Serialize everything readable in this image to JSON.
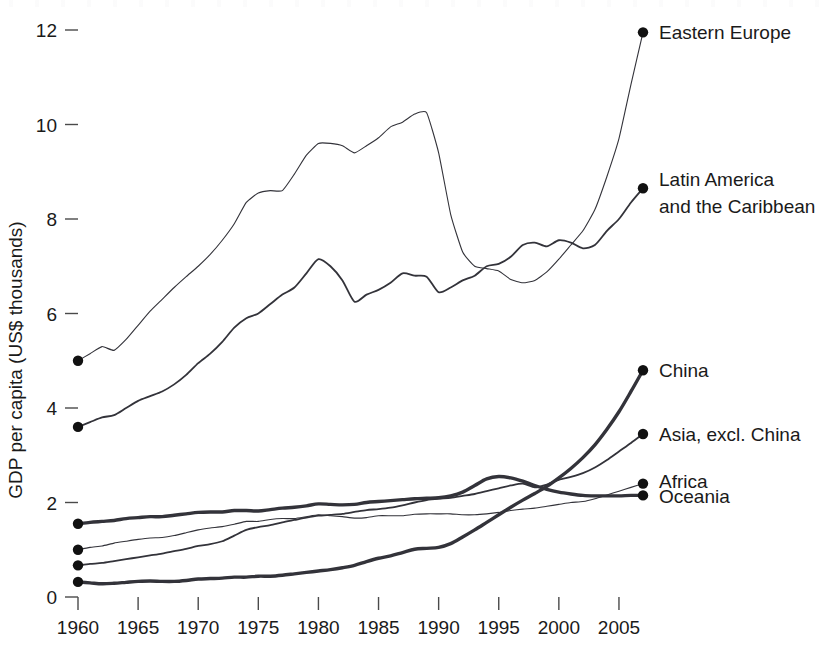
{
  "chart_data": {
    "type": "line",
    "title": "",
    "subtitle": "",
    "xlabel": "",
    "ylabel": "GDP per capita (US$ thousands)",
    "xlim": [
      1960,
      2007
    ],
    "ylim": [
      0,
      12
    ],
    "grid": false,
    "legend_position": "right-inline-endpoint-labels",
    "xticks": [
      1960,
      1965,
      1970,
      1975,
      1980,
      1985,
      1990,
      1995,
      2000,
      2005
    ],
    "xtick_labels": [
      "1960",
      "1965",
      "1970",
      "1975",
      "1980",
      "1985",
      "1990",
      "1995",
      "2000",
      "2005"
    ],
    "yticks": [
      0,
      2,
      4,
      6,
      8,
      10,
      12
    ],
    "ytick_labels": [
      "0",
      "2",
      "4",
      "6",
      "8",
      "10",
      "12"
    ],
    "x": [
      1960,
      1961,
      1962,
      1963,
      1964,
      1965,
      1966,
      1967,
      1968,
      1969,
      1970,
      1971,
      1972,
      1973,
      1974,
      1975,
      1976,
      1977,
      1978,
      1979,
      1980,
      1981,
      1982,
      1983,
      1984,
      1985,
      1986,
      1987,
      1988,
      1989,
      1990,
      1991,
      1992,
      1993,
      1994,
      1995,
      1996,
      1997,
      1998,
      1999,
      2000,
      2001,
      2002,
      2003,
      2004,
      2005,
      2006,
      2007
    ],
    "series": [
      {
        "name": "Eastern Europe",
        "label": "Eastern Europe",
        "style": "thin",
        "end_value": 11.95,
        "values": [
          5.0,
          5.15,
          5.3,
          5.22,
          5.45,
          5.75,
          6.05,
          6.3,
          6.55,
          6.78,
          7.0,
          7.25,
          7.55,
          7.9,
          8.35,
          8.55,
          8.6,
          8.6,
          8.95,
          9.35,
          9.6,
          9.6,
          9.55,
          9.4,
          9.55,
          9.72,
          9.95,
          10.05,
          10.22,
          10.25,
          9.4,
          8.1,
          7.3,
          7.0,
          6.95,
          6.9,
          6.72,
          6.65,
          6.7,
          6.88,
          7.15,
          7.45,
          7.75,
          8.2,
          8.9,
          9.7,
          10.85,
          11.95
        ]
      },
      {
        "name": "Latin America and the Caribbean",
        "label": "Latin America\nand the Caribbean",
        "style": "medium",
        "end_value": 8.65,
        "values": [
          3.6,
          3.7,
          3.8,
          3.85,
          4.0,
          4.15,
          4.25,
          4.35,
          4.5,
          4.7,
          4.95,
          5.15,
          5.4,
          5.7,
          5.9,
          6.0,
          6.2,
          6.4,
          6.55,
          6.85,
          7.15,
          7.0,
          6.7,
          6.25,
          6.4,
          6.5,
          6.65,
          6.85,
          6.8,
          6.78,
          6.45,
          6.55,
          6.7,
          6.8,
          7.0,
          7.05,
          7.2,
          7.45,
          7.5,
          7.42,
          7.55,
          7.5,
          7.38,
          7.45,
          7.75,
          8.0,
          8.35,
          8.65
        ]
      },
      {
        "name": "China",
        "label": "China",
        "style": "thick",
        "end_value": 4.8,
        "values": [
          0.32,
          0.3,
          0.28,
          0.29,
          0.31,
          0.33,
          0.34,
          0.33,
          0.33,
          0.35,
          0.38,
          0.39,
          0.4,
          0.42,
          0.42,
          0.44,
          0.44,
          0.46,
          0.49,
          0.52,
          0.55,
          0.58,
          0.62,
          0.67,
          0.75,
          0.82,
          0.87,
          0.94,
          1.01,
          1.03,
          1.05,
          1.13,
          1.27,
          1.42,
          1.58,
          1.74,
          1.9,
          2.05,
          2.19,
          2.34,
          2.52,
          2.72,
          2.95,
          3.22,
          3.55,
          3.92,
          4.35,
          4.8
        ]
      },
      {
        "name": "Asia, excl. China",
        "label": "Asia, excl. China",
        "style": "medium",
        "end_value": 3.45,
        "values": [
          0.67,
          0.7,
          0.72,
          0.76,
          0.8,
          0.84,
          0.88,
          0.92,
          0.97,
          1.02,
          1.08,
          1.12,
          1.18,
          1.3,
          1.42,
          1.48,
          1.52,
          1.58,
          1.63,
          1.68,
          1.72,
          1.74,
          1.76,
          1.8,
          1.84,
          1.86,
          1.89,
          1.94,
          2.0,
          2.05,
          2.08,
          2.1,
          2.14,
          2.18,
          2.24,
          2.3,
          2.36,
          2.4,
          2.32,
          2.38,
          2.48,
          2.54,
          2.62,
          2.74,
          2.9,
          3.08,
          3.26,
          3.45
        ]
      },
      {
        "name": "Africa",
        "label": "Africa",
        "style": "thin",
        "end_value": 2.4,
        "values": [
          1.0,
          1.05,
          1.08,
          1.14,
          1.18,
          1.22,
          1.25,
          1.26,
          1.3,
          1.36,
          1.42,
          1.46,
          1.49,
          1.54,
          1.6,
          1.6,
          1.64,
          1.66,
          1.66,
          1.7,
          1.74,
          1.72,
          1.7,
          1.67,
          1.68,
          1.72,
          1.72,
          1.72,
          1.75,
          1.76,
          1.76,
          1.76,
          1.74,
          1.74,
          1.76,
          1.79,
          1.83,
          1.86,
          1.88,
          1.92,
          1.96,
          2.0,
          2.02,
          2.08,
          2.16,
          2.24,
          2.32,
          2.4
        ]
      },
      {
        "name": "Oceania",
        "label": "Oceania",
        "style": "thick",
        "end_value": 2.15,
        "values": [
          1.55,
          1.58,
          1.6,
          1.62,
          1.66,
          1.68,
          1.7,
          1.7,
          1.73,
          1.76,
          1.79,
          1.8,
          1.8,
          1.83,
          1.83,
          1.82,
          1.85,
          1.88,
          1.9,
          1.93,
          1.97,
          1.96,
          1.95,
          1.96,
          2.0,
          2.02,
          2.04,
          2.06,
          2.08,
          2.09,
          2.1,
          2.14,
          2.22,
          2.36,
          2.5,
          2.55,
          2.52,
          2.45,
          2.36,
          2.28,
          2.22,
          2.18,
          2.15,
          2.14,
          2.14,
          2.14,
          2.15,
          2.15
        ]
      }
    ]
  },
  "axis": {
    "y_title": "GDP per capita (US$ thousands)"
  },
  "labels": {
    "eastern_europe": "Eastern Europe",
    "latin_america_line1": "Latin America",
    "latin_america_line2": "and the Caribbean",
    "china": "China",
    "asia_excl_china": "Asia, excl. China",
    "africa": "Africa",
    "oceania": "Oceania"
  },
  "colors": {
    "ink": "#1a1a1a",
    "line": "#33333a",
    "background": "#ffffff"
  }
}
